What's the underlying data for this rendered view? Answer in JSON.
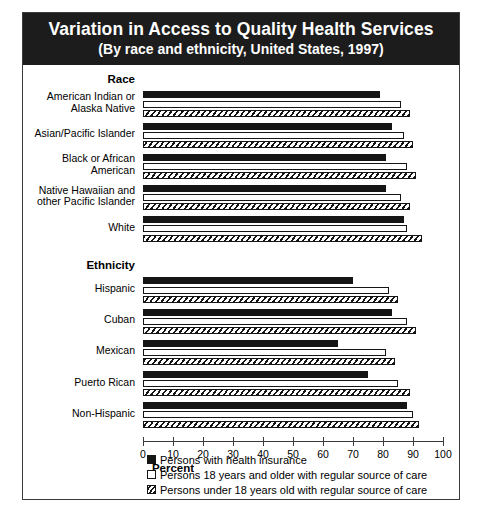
{
  "title": {
    "line1": "Variation in Access to Quality Health Services",
    "line2": "(By race and ethnicity, United States, 1997)"
  },
  "chart_data": {
    "type": "bar",
    "orientation": "horizontal",
    "title": "Variation in Access to Quality Health Services",
    "subtitle": "(By race and ethnicity, United States, 1997)",
    "xlabel": "Percent",
    "ylabel": "",
    "xlim": [
      0,
      100
    ],
    "xticks": [
      0,
      10,
      20,
      30,
      40,
      50,
      60,
      70,
      80,
      90,
      100
    ],
    "xtick_labels": [
      "0",
      "10",
      "20",
      "30",
      "40",
      "50",
      "60",
      "70",
      "80",
      "90",
      "100"
    ],
    "grid": false,
    "legend_position": "bottom-left",
    "group_headers": [
      "Race",
      "Ethnicity"
    ],
    "groups": [
      {
        "name": "Race",
        "categories": [
          "American Indian or Alaska Native",
          "Asian/Pacific Islander",
          "Black or African American",
          "Native Hawaiian and other Pacific Islander",
          "White"
        ]
      },
      {
        "name": "Ethnicity",
        "categories": [
          "Hispanic",
          "Cuban",
          "Mexican",
          "Puerto Rican",
          "Non-Hispanic"
        ]
      }
    ],
    "categories": [
      "American Indian or Alaska Native",
      "Asian/Pacific Islander",
      "Black or African American",
      "Native Hawaiian and other Pacific Islander",
      "White",
      "Hispanic",
      "Cuban",
      "Mexican",
      "Puerto Rican",
      "Non-Hispanic"
    ],
    "series": [
      {
        "name": "Persons with health insurance",
        "swatch": "solid-black",
        "values": [
          79,
          83,
          81,
          81,
          87,
          70,
          83,
          65,
          75,
          88
        ]
      },
      {
        "name": "Persons 18 years and older with regular source of care",
        "swatch": "open-white",
        "values": [
          86,
          87,
          88,
          86,
          88,
          82,
          88,
          81,
          85,
          90
        ]
      },
      {
        "name": "Persons under 18 years old with regular source of care",
        "swatch": "hatched",
        "values": [
          89,
          90,
          91,
          89,
          93,
          85,
          91,
          84,
          89,
          92
        ]
      }
    ]
  },
  "axis": {
    "title": "Percent"
  },
  "legend": {
    "items": [
      {
        "label": "Persons with health insurance",
        "swatch": "solid-black"
      },
      {
        "label": "Persons 18 years and older with regular source of care",
        "swatch": "open-white"
      },
      {
        "label": "Persons under 18 years old with regular source of care",
        "swatch": "hatched"
      }
    ]
  }
}
